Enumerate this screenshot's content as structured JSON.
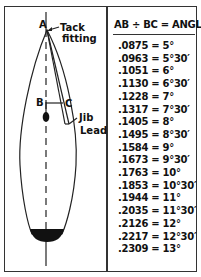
{
  "diagram": {
    "labels": {
      "a": "A",
      "b": "B",
      "c": "C",
      "tack": "Tack\nfitting",
      "tack_line1": "Tack",
      "tack_line2": "fitting",
      "jib_line1": "Jib",
      "jib_line2": "Lead"
    },
    "colors": {
      "ink": "#111111",
      "background": "#ffffff"
    }
  },
  "table": {
    "header": "AB ÷ BC = ANGLE",
    "rows": [
      {
        "ratio": ".0875",
        "angle": "5°"
      },
      {
        "ratio": ".0963",
        "angle": "5°30′"
      },
      {
        "ratio": ".1051",
        "angle": "6°"
      },
      {
        "ratio": ".1130",
        "angle": "6°30′"
      },
      {
        "ratio": ".1228",
        "angle": "7°"
      },
      {
        "ratio": ".1317",
        "angle": "7°30′"
      },
      {
        "ratio": ".1405",
        "angle": "8°"
      },
      {
        "ratio": ".1495",
        "angle": "8°30′"
      },
      {
        "ratio": ".1584",
        "angle": "9°"
      },
      {
        "ratio": ".1673",
        "angle": "9°30′"
      },
      {
        "ratio": ".1763",
        "angle": "10°"
      },
      {
        "ratio": ".1853",
        "angle": "10°30′"
      },
      {
        "ratio": ".1944",
        "angle": "11°"
      },
      {
        "ratio": ".2035",
        "angle": "11°30′"
      },
      {
        "ratio": ".2126",
        "angle": "12°"
      },
      {
        "ratio": ".2217",
        "angle": "12°30′"
      },
      {
        "ratio": ".2309",
        "angle": "13°"
      }
    ],
    "row_text": [
      ".0875 = 5°",
      ".0963 = 5°30′",
      ".1051 = 6°",
      ".1130 = 6°30′",
      ".1228 = 7°",
      ".1317 = 7°30′",
      ".1405 = 8°",
      ".1495 = 8°30′",
      ".1584 = 9°",
      ".1673 = 9°30′",
      ".1763 = 10°",
      ".1853 = 10°30′",
      ".1944 = 11°",
      ".2035 = 11°30′",
      ".2126 = 12°",
      ".2217 = 12°30′",
      ".2309 = 13°"
    ]
  }
}
